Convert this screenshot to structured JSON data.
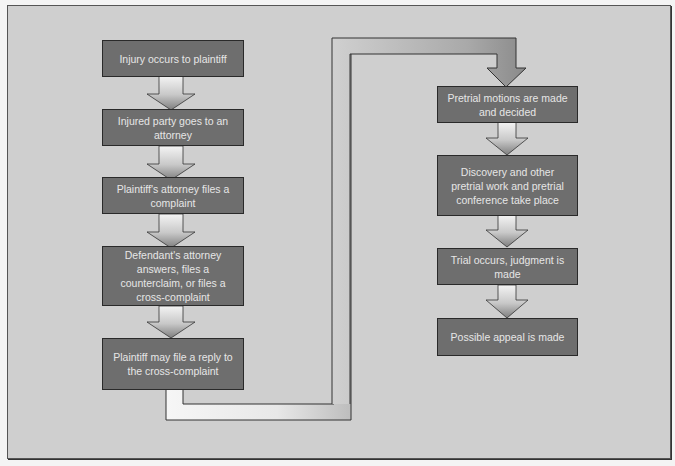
{
  "diagram": {
    "type": "flowchart",
    "colors": {
      "background": "#cfcfcf",
      "box_fill": "#6e6e6e",
      "box_border": "#2a2a2a",
      "box_text": "#e6e6e6",
      "arrow_light": "#f2f2f2",
      "arrow_dark": "#8a8a8a"
    },
    "left_column": [
      {
        "id": "step1",
        "label": "Injury occurs to plaintiff"
      },
      {
        "id": "step2",
        "label": "Injured party goes to an attorney"
      },
      {
        "id": "step3",
        "label": "Plaintiff's attorney files a complaint"
      },
      {
        "id": "step4",
        "label": "Defendant's attorney answers, files a counterclaim, or files a cross-complaint"
      },
      {
        "id": "step5",
        "label": "Plaintiff may file a reply to the cross-complaint"
      }
    ],
    "right_column": [
      {
        "id": "step6",
        "label": "Pretrial motions are made and decided"
      },
      {
        "id": "step7",
        "label": "Discovery and other pretrial work and pretrial conference take place"
      },
      {
        "id": "step8",
        "label": "Trial occurs, judgment is made"
      },
      {
        "id": "step9",
        "label": "Possible appeal is made"
      }
    ],
    "edges": [
      [
        "step1",
        "step2"
      ],
      [
        "step2",
        "step3"
      ],
      [
        "step3",
        "step4"
      ],
      [
        "step4",
        "step5"
      ],
      [
        "step5",
        "step6"
      ],
      [
        "step6",
        "step7"
      ],
      [
        "step7",
        "step8"
      ],
      [
        "step8",
        "step9"
      ]
    ]
  }
}
